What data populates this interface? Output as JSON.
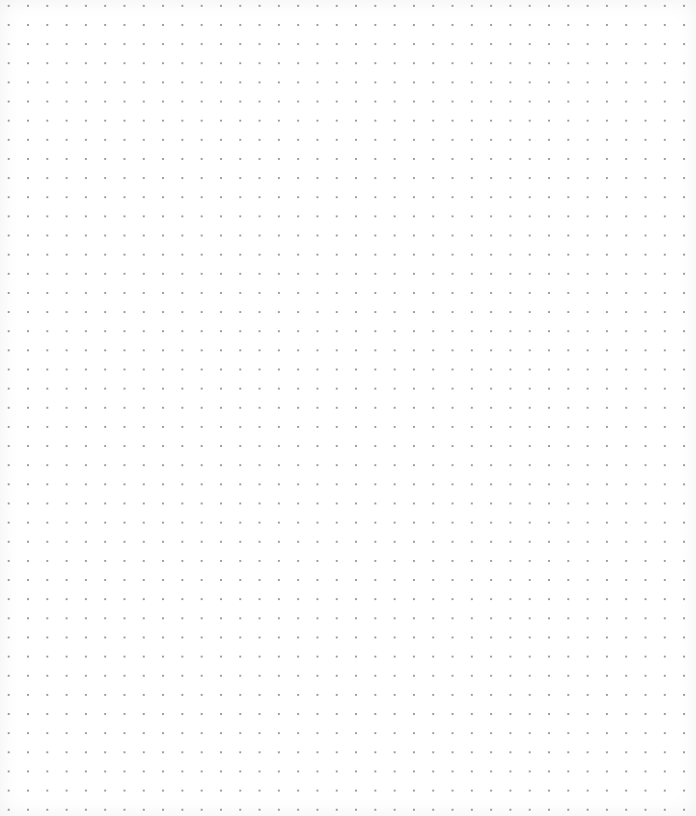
{
  "canvas": {
    "type": "dot-grid",
    "background_color": "#ffffff",
    "dot_color": "#9a9a9a",
    "dot_spacing_px": 19.3,
    "columns": 35,
    "rows": 41
  }
}
